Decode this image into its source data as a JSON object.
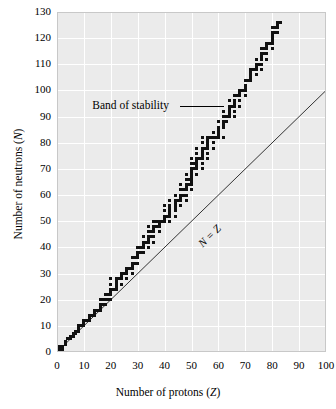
{
  "chart_data": {
    "type": "scatter",
    "title": "",
    "xlabel": "Number of protons (Z)",
    "ylabel": "Number of neutrons (N)",
    "xlim": [
      0,
      100
    ],
    "ylim": [
      0,
      130
    ],
    "xticks": [
      0,
      10,
      20,
      30,
      40,
      50,
      60,
      70,
      80,
      90,
      100
    ],
    "yticks": [
      0,
      10,
      20,
      30,
      40,
      50,
      60,
      70,
      80,
      90,
      100,
      110,
      120,
      130
    ],
    "grid": true,
    "legend": "none",
    "background": "#ebebeb",
    "gridline_color": "#ffffff",
    "marker_color": "#111111",
    "marker_shape": "square",
    "annotations": [
      {
        "text": "Band of stability",
        "x": 25,
        "y": 94,
        "leader_to_x": 62,
        "leader_to_y": 94
      },
      {
        "text": "N = Z",
        "x": 52,
        "y": 47,
        "rotated": true,
        "italic": true
      }
    ],
    "reference_lines": [
      {
        "name": "N = Z",
        "from": [
          0,
          0
        ],
        "to": [
          100,
          100
        ],
        "color": "#333333"
      }
    ],
    "series": [
      {
        "name": "Stable nuclides (band of stability)",
        "points": [
          [
            1,
            0
          ],
          [
            1,
            1
          ],
          [
            1,
            2
          ],
          [
            2,
            1
          ],
          [
            2,
            2
          ],
          [
            3,
            3
          ],
          [
            3,
            4
          ],
          [
            4,
            5
          ],
          [
            5,
            5
          ],
          [
            5,
            6
          ],
          [
            6,
            6
          ],
          [
            6,
            7
          ],
          [
            7,
            7
          ],
          [
            7,
            8
          ],
          [
            8,
            8
          ],
          [
            8,
            9
          ],
          [
            8,
            10
          ],
          [
            9,
            10
          ],
          [
            10,
            10
          ],
          [
            10,
            11
          ],
          [
            10,
            12
          ],
          [
            11,
            12
          ],
          [
            12,
            12
          ],
          [
            12,
            13
          ],
          [
            12,
            14
          ],
          [
            13,
            14
          ],
          [
            14,
            14
          ],
          [
            14,
            15
          ],
          [
            14,
            16
          ],
          [
            15,
            16
          ],
          [
            16,
            16
          ],
          [
            16,
            17
          ],
          [
            16,
            18
          ],
          [
            16,
            20
          ],
          [
            17,
            18
          ],
          [
            17,
            20
          ],
          [
            18,
            18
          ],
          [
            18,
            20
          ],
          [
            18,
            22
          ],
          [
            19,
            20
          ],
          [
            19,
            22
          ],
          [
            20,
            20
          ],
          [
            20,
            22
          ],
          [
            20,
            23
          ],
          [
            20,
            24
          ],
          [
            20,
            26
          ],
          [
            20,
            28
          ],
          [
            21,
            24
          ],
          [
            22,
            24
          ],
          [
            22,
            25
          ],
          [
            22,
            26
          ],
          [
            22,
            27
          ],
          [
            22,
            28
          ],
          [
            23,
            28
          ],
          [
            24,
            26
          ],
          [
            24,
            28
          ],
          [
            24,
            29
          ],
          [
            24,
            30
          ],
          [
            25,
            30
          ],
          [
            26,
            28
          ],
          [
            26,
            30
          ],
          [
            26,
            31
          ],
          [
            26,
            32
          ],
          [
            27,
            32
          ],
          [
            28,
            30
          ],
          [
            28,
            32
          ],
          [
            28,
            33
          ],
          [
            28,
            34
          ],
          [
            28,
            36
          ],
          [
            29,
            34
          ],
          [
            29,
            36
          ],
          [
            30,
            34
          ],
          [
            30,
            36
          ],
          [
            30,
            37
          ],
          [
            30,
            38
          ],
          [
            30,
            40
          ],
          [
            31,
            38
          ],
          [
            31,
            40
          ],
          [
            32,
            38
          ],
          [
            32,
            40
          ],
          [
            32,
            41
          ],
          [
            32,
            42
          ],
          [
            32,
            44
          ],
          [
            33,
            42
          ],
          [
            34,
            40
          ],
          [
            34,
            42
          ],
          [
            34,
            43
          ],
          [
            34,
            44
          ],
          [
            34,
            46
          ],
          [
            34,
            48
          ],
          [
            35,
            44
          ],
          [
            35,
            46
          ],
          [
            36,
            42
          ],
          [
            36,
            44
          ],
          [
            36,
            46
          ],
          [
            36,
            47
          ],
          [
            36,
            48
          ],
          [
            36,
            50
          ],
          [
            37,
            48
          ],
          [
            37,
            50
          ],
          [
            38,
            46
          ],
          [
            38,
            48
          ],
          [
            38,
            49
          ],
          [
            38,
            50
          ],
          [
            39,
            50
          ],
          [
            40,
            50
          ],
          [
            40,
            51
          ],
          [
            40,
            52
          ],
          [
            40,
            54
          ],
          [
            40,
            56
          ],
          [
            41,
            52
          ],
          [
            42,
            50
          ],
          [
            42,
            52
          ],
          [
            42,
            53
          ],
          [
            42,
            54
          ],
          [
            42,
            55
          ],
          [
            42,
            56
          ],
          [
            42,
            58
          ],
          [
            44,
            52
          ],
          [
            44,
            54
          ],
          [
            44,
            55
          ],
          [
            44,
            56
          ],
          [
            44,
            57
          ],
          [
            44,
            58
          ],
          [
            44,
            60
          ],
          [
            45,
            58
          ],
          [
            46,
            56
          ],
          [
            46,
            58
          ],
          [
            46,
            59
          ],
          [
            46,
            60
          ],
          [
            46,
            62
          ],
          [
            46,
            64
          ],
          [
            47,
            60
          ],
          [
            47,
            62
          ],
          [
            48,
            58
          ],
          [
            48,
            60
          ],
          [
            48,
            62
          ],
          [
            48,
            63
          ],
          [
            48,
            64
          ],
          [
            48,
            66
          ],
          [
            48,
            68
          ],
          [
            49,
            64
          ],
          [
            49,
            66
          ],
          [
            50,
            62
          ],
          [
            50,
            64
          ],
          [
            50,
            65
          ],
          [
            50,
            66
          ],
          [
            50,
            67
          ],
          [
            50,
            68
          ],
          [
            50,
            69
          ],
          [
            50,
            70
          ],
          [
            50,
            72
          ],
          [
            50,
            74
          ],
          [
            51,
            70
          ],
          [
            51,
            72
          ],
          [
            52,
            68
          ],
          [
            52,
            70
          ],
          [
            52,
            71
          ],
          [
            52,
            72
          ],
          [
            52,
            73
          ],
          [
            52,
            74
          ],
          [
            52,
            76
          ],
          [
            52,
            78
          ],
          [
            53,
            74
          ],
          [
            54,
            70
          ],
          [
            54,
            72
          ],
          [
            54,
            74
          ],
          [
            54,
            75
          ],
          [
            54,
            76
          ],
          [
            54,
            77
          ],
          [
            54,
            78
          ],
          [
            54,
            80
          ],
          [
            54,
            82
          ],
          [
            55,
            78
          ],
          [
            56,
            74
          ],
          [
            56,
            76
          ],
          [
            56,
            78
          ],
          [
            56,
            79
          ],
          [
            56,
            80
          ],
          [
            56,
            81
          ],
          [
            56,
            82
          ],
          [
            57,
            82
          ],
          [
            58,
            78
          ],
          [
            58,
            80
          ],
          [
            58,
            82
          ],
          [
            58,
            84
          ],
          [
            59,
            82
          ],
          [
            60,
            82
          ],
          [
            60,
            83
          ],
          [
            60,
            84
          ],
          [
            60,
            85
          ],
          [
            60,
            86
          ],
          [
            60,
            88
          ],
          [
            62,
            82
          ],
          [
            62,
            86
          ],
          [
            62,
            87
          ],
          [
            62,
            88
          ],
          [
            62,
            90
          ],
          [
            62,
            92
          ],
          [
            63,
            88
          ],
          [
            63,
            90
          ],
          [
            64,
            90
          ],
          [
            64,
            91
          ],
          [
            64,
            92
          ],
          [
            64,
            93
          ],
          [
            64,
            94
          ],
          [
            64,
            96
          ],
          [
            65,
            94
          ],
          [
            66,
            90
          ],
          [
            66,
            92
          ],
          [
            66,
            94
          ],
          [
            66,
            95
          ],
          [
            66,
            96
          ],
          [
            66,
            98
          ],
          [
            67,
            98
          ],
          [
            68,
            94
          ],
          [
            68,
            96
          ],
          [
            68,
            98
          ],
          [
            68,
            99
          ],
          [
            68,
            100
          ],
          [
            69,
            100
          ],
          [
            70,
            98
          ],
          [
            70,
            100
          ],
          [
            70,
            101
          ],
          [
            70,
            102
          ],
          [
            70,
            104
          ],
          [
            71,
            104
          ],
          [
            72,
            104
          ],
          [
            72,
            105
          ],
          [
            72,
            106
          ],
          [
            72,
            107
          ],
          [
            72,
            108
          ],
          [
            73,
            108
          ],
          [
            74,
            106
          ],
          [
            74,
            108
          ],
          [
            74,
            109
          ],
          [
            74,
            110
          ],
          [
            74,
            112
          ],
          [
            75,
            110
          ],
          [
            76,
            108
          ],
          [
            76,
            110
          ],
          [
            76,
            112
          ],
          [
            76,
            113
          ],
          [
            76,
            114
          ],
          [
            76,
            116
          ],
          [
            77,
            114
          ],
          [
            77,
            116
          ],
          [
            78,
            112
          ],
          [
            78,
            114
          ],
          [
            78,
            116
          ],
          [
            78,
            117
          ],
          [
            78,
            118
          ],
          [
            79,
            118
          ],
          [
            80,
            116
          ],
          [
            80,
            118
          ],
          [
            80,
            119
          ],
          [
            80,
            120
          ],
          [
            80,
            121
          ],
          [
            80,
            122
          ],
          [
            80,
            124
          ],
          [
            81,
            122
          ],
          [
            81,
            124
          ],
          [
            82,
            122
          ],
          [
            82,
            124
          ],
          [
            82,
            125
          ],
          [
            82,
            126
          ],
          [
            83,
            126
          ]
        ]
      }
    ]
  }
}
